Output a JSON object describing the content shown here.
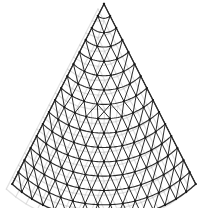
{
  "figure": {
    "background_color": "#ffffff",
    "width": 207,
    "height": 208
  },
  "chart_data": {
    "type": "diagram",
    "subtype": "triangulated-cone-mesh",
    "title": "",
    "xlabel": "",
    "ylabel": "",
    "geometry": {
      "apex": [
        104,
        4
      ],
      "left_corner": [
        12,
        184
      ],
      "right_corner": [
        196,
        183
      ],
      "bottom_arc_center_y": 196,
      "radial_rows": 15,
      "row_spacing_px": 12.8,
      "half_angle_deg": 27,
      "bottom_arc_bulge_px": 13,
      "angular_divisions_at_base": 16
    },
    "style": {
      "line_color": "#2b2b2b",
      "line_width": 1.0,
      "arc_line_width": 1.1,
      "node_color": "#1a1a1a",
      "node_radius": 1.15,
      "ghost_color": "#c9c9c9",
      "ghost_opacity": 0.55,
      "grid": false,
      "legend": false
    },
    "elements": [
      {
        "name": "radial-lines",
        "count": 17
      },
      {
        "name": "arc-rows",
        "count": 15
      },
      {
        "name": "diagonal-lines",
        "count": 240
      },
      {
        "name": "vertex-nodes",
        "count": 145
      }
    ]
  }
}
